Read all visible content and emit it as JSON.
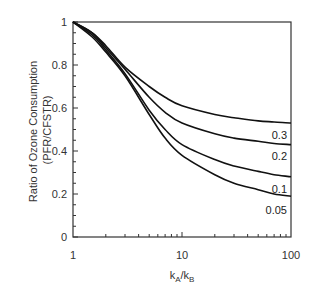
{
  "chart_data": {
    "type": "line",
    "title": "",
    "xlabel": "kA/kB",
    "xlabel_parts": {
      "main1": "k",
      "sub1": "A",
      "slash": "/",
      "main2": "k",
      "sub2": "B"
    },
    "ylabel": "Ratio of Ozone Consumption (PFR/CFSTR)",
    "ylabel_line1": "Ratio of Ozone Consumption",
    "ylabel_line2": "(PFR/CFSTR)",
    "xscale": "log",
    "xlim": [
      1,
      100
    ],
    "ylim": [
      0,
      1
    ],
    "x_ticks": [
      {
        "value": 1,
        "label": "1"
      },
      {
        "value": 10,
        "label": "10"
      },
      {
        "value": 100,
        "label": "100"
      }
    ],
    "y_ticks": [
      {
        "value": 0,
        "label": "0"
      },
      {
        "value": 0.2,
        "label": "0.2"
      },
      {
        "value": 0.4,
        "label": "0.4"
      },
      {
        "value": 0.6,
        "label": "0.6"
      },
      {
        "value": 0.8,
        "label": "0.8"
      },
      {
        "value": 1,
        "label": "1"
      }
    ],
    "grid": false,
    "legend": "inline labels at right end of curves",
    "x": [
      1,
      1.5,
      2,
      3,
      5,
      7,
      10,
      20,
      30,
      50,
      70,
      100
    ],
    "series": [
      {
        "name": "0.3",
        "values": [
          1,
          0.95,
          0.89,
          0.79,
          0.7,
          0.65,
          0.61,
          0.57,
          0.555,
          0.54,
          0.535,
          0.53
        ]
      },
      {
        "name": "0.2",
        "values": [
          1,
          0.95,
          0.88,
          0.78,
          0.65,
          0.58,
          0.53,
          0.48,
          0.46,
          0.445,
          0.435,
          0.43
        ]
      },
      {
        "name": "0.1",
        "values": [
          1,
          0.94,
          0.87,
          0.76,
          0.59,
          0.5,
          0.43,
          0.36,
          0.33,
          0.305,
          0.29,
          0.28
        ]
      },
      {
        "name": "0.05",
        "values": [
          1,
          0.93,
          0.86,
          0.75,
          0.57,
          0.46,
          0.38,
          0.29,
          0.25,
          0.22,
          0.2,
          0.19
        ]
      }
    ],
    "curve_label_positions": [
      {
        "name": "0.3",
        "y_value": 0.475
      },
      {
        "name": "0.2",
        "y_value": 0.375
      },
      {
        "name": "0.1",
        "y_value": 0.225
      },
      {
        "name": "0.05",
        "y_value": 0.125
      }
    ]
  }
}
